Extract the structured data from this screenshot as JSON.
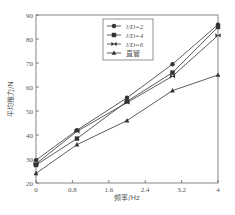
{
  "chart_data": {
    "type": "line",
    "title": "",
    "xlabel": "频率/Hz",
    "ylabel": "平均推力/N",
    "xlim": [
      0,
      4
    ],
    "ylim": [
      20,
      90
    ],
    "xticks": [
      "0",
      "0.8",
      "1.6",
      "2.4",
      "3.2",
      "4"
    ],
    "yticks": [
      "20",
      "30",
      "40",
      "50",
      "60",
      "70",
      "80",
      "90"
    ],
    "grid": false,
    "legend_position": "upper center",
    "x": [
      0,
      0.9,
      2.0,
      3.0,
      4.0
    ],
    "series": [
      {
        "name": "l/D=2",
        "marker": "diamond",
        "values": [
          29.5,
          42,
          55.5,
          69.5,
          86
        ]
      },
      {
        "name": "l/D=4",
        "marker": "square",
        "values": [
          27.5,
          38.5,
          54,
          66,
          85
        ]
      },
      {
        "name": "l/D=6",
        "marker": "bowtie",
        "values": [
          28,
          41.5,
          53.5,
          64.5,
          81.5
        ]
      },
      {
        "name": "直管",
        "marker": "triangle",
        "values": [
          24,
          36,
          46,
          58.5,
          65
        ]
      }
    ]
  },
  "colors": {
    "line": "#333333",
    "axis": "#666666",
    "text": "#555555"
  }
}
